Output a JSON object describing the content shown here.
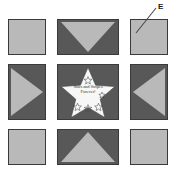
{
  "figure": {
    "name": "quilt-block-layout",
    "palette": {
      "light_fabric": "#b9b9b9",
      "dark_fabric": "#585858",
      "star_fill": "#f7f7f7",
      "outline": "#3a3a3a",
      "background": "#ffffff",
      "label_color": "#1a1a1a"
    },
    "callout": {
      "label": "E",
      "points_to": "top-right-corner-block"
    },
    "center": {
      "motif": "five-point-star",
      "caption_line_1": "Stars and Stripes",
      "caption_line_2": "Forever!",
      "small_star_count": 5
    },
    "blocks": [
      {
        "position": "top-left",
        "type": "plain-square",
        "fill": "light",
        "triangle": "none"
      },
      {
        "position": "top-center",
        "type": "triangle-block",
        "fill": "dark",
        "triangle": "down"
      },
      {
        "position": "top-right",
        "type": "plain-square",
        "fill": "light",
        "triangle": "none"
      },
      {
        "position": "middle-left",
        "type": "triangle-block",
        "fill": "dark",
        "triangle": "right"
      },
      {
        "position": "center",
        "type": "star-block",
        "fill": "dark",
        "triangle": "none"
      },
      {
        "position": "middle-right",
        "type": "triangle-block",
        "fill": "dark",
        "triangle": "left"
      },
      {
        "position": "bottom-left",
        "type": "plain-square",
        "fill": "light",
        "triangle": "none"
      },
      {
        "position": "bottom-center",
        "type": "triangle-block",
        "fill": "dark",
        "triangle": "up"
      },
      {
        "position": "bottom-right",
        "type": "plain-square",
        "fill": "light",
        "triangle": "none"
      }
    ]
  }
}
